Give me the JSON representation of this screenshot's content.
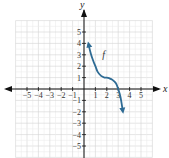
{
  "chart_data": {
    "type": "line",
    "title": "",
    "xlabel": "x",
    "ylabel": "y",
    "xlim": [
      -6,
      6
    ],
    "ylim": [
      -6,
      6
    ],
    "grid": true,
    "x_ticks": [
      -5,
      -4,
      -3,
      -2,
      -1,
      1,
      2,
      3,
      4,
      5
    ],
    "y_ticks": [
      5,
      4,
      3,
      2,
      1,
      -1,
      -2,
      -3,
      -4,
      -5
    ],
    "x_tick_labels": [
      "−5",
      "−4",
      "−3",
      "−2",
      "−1",
      "1",
      "2",
      "3",
      "4",
      "5"
    ],
    "y_tick_labels": [
      "5",
      "4",
      "3",
      "2",
      "1",
      "−1",
      "−2",
      "−3",
      "−4",
      "−5"
    ],
    "series": [
      {
        "name": "f",
        "color": "#2e6b94",
        "arrows": "both",
        "points": [
          [
            0.4,
            3.9
          ],
          [
            0.6,
            3.1
          ],
          [
            0.8,
            2.5
          ],
          [
            1.0,
            2.0
          ],
          [
            1.2,
            1.5
          ],
          [
            1.5,
            1.15
          ],
          [
            1.8,
            1.0
          ],
          [
            2.0,
            1.0
          ],
          [
            2.2,
            0.95
          ],
          [
            2.5,
            0.8
          ],
          [
            2.8,
            0.5
          ],
          [
            3.0,
            0.0
          ],
          [
            3.2,
            -0.7
          ],
          [
            3.4,
            -1.9
          ]
        ]
      }
    ],
    "annotations": [
      {
        "text": "f",
        "x": 1.6,
        "y": 2.7
      }
    ]
  },
  "labels": {
    "x_axis": "x",
    "y_axis": "y",
    "function": "f"
  }
}
